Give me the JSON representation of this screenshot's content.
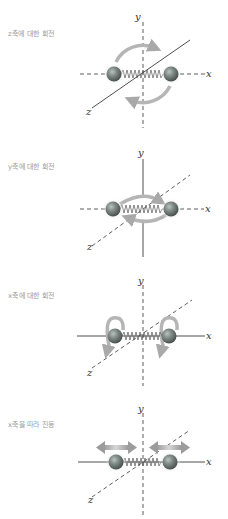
{
  "figure": {
    "top_cut_text": "",
    "panels": [
      {
        "id": "rotation-z",
        "label": "z축에 대한 회전",
        "axes": {
          "x": "x",
          "y": "y",
          "z": "z"
        },
        "solid_axis": "z",
        "motion": "rotation about z-axis (circular arrows in xy-plane)"
      },
      {
        "id": "rotation-y",
        "label": "y축에 대한 회전",
        "axes": {
          "x": "x",
          "y": "y",
          "z": "z"
        },
        "solid_axis": "y",
        "motion": "rotation about y-axis (elliptical arrows in xz-plane)"
      },
      {
        "id": "rotation-x",
        "label": "x축에 대한 회전",
        "axes": {
          "x": "x",
          "y": "y",
          "z": "z"
        },
        "solid_axis": "x",
        "motion": "rotation about x-axis (curled arrows around each atom)"
      },
      {
        "id": "vibration-x",
        "label": "x축을 따라 진동",
        "axes": {
          "x": "x",
          "y": "y",
          "z": "z"
        },
        "solid_axis": "x",
        "motion": "vibration along x-axis (double-headed arrows)"
      }
    ],
    "colors": {
      "label_text": "#9a9a9a",
      "axis_line": "#333333",
      "arrow": "#a9a9a9",
      "atom": "#7f8a86",
      "spring": "#555555"
    }
  }
}
